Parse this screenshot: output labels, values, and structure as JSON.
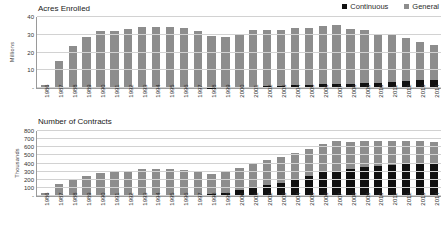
{
  "legend": {
    "items": [
      {
        "label": "Continuous",
        "icon": "square-swatch",
        "color": "#111111"
      },
      {
        "label": "General",
        "icon": "square-swatch",
        "color": "#8d8d8d"
      }
    ]
  },
  "chart_data": [
    {
      "type": "bar",
      "stacked": true,
      "title": "Acres Enrolled",
      "xlabel": "",
      "ylabel": "Millions",
      "ylim": [
        0,
        40
      ],
      "yticks": [
        0,
        10,
        20,
        30,
        40
      ],
      "ytick_labels": [
        "-",
        "10",
        "20",
        "30",
        "40"
      ],
      "grid": true,
      "legend_position": "top-right",
      "categories": [
        "1986",
        "1987",
        "1988",
        "1989",
        "1990",
        "1991",
        "1992",
        "1993",
        "1994",
        "1995",
        "1996",
        "1997",
        "1998",
        "1999",
        "2000",
        "2001",
        "2002",
        "2003",
        "2004",
        "2005",
        "2006",
        "2007",
        "2008",
        "2009",
        "2010",
        "2011",
        "2012",
        "2013",
        "2014"
      ],
      "series": [
        {
          "name": "Continuous",
          "color": "#111111",
          "values": [
            0,
            0,
            0,
            0,
            0,
            0,
            0,
            0,
            0,
            0,
            0,
            0,
            0.2,
            0.3,
            0.5,
            0.8,
            1.0,
            1.3,
            1.6,
            1.9,
            2.0,
            2.1,
            2.3,
            2.6,
            3.1,
            3.6,
            3.9,
            4.4,
            4.6
          ]
        },
        {
          "name": "General",
          "color": "#8d8d8d",
          "values": [
            1.5,
            15.2,
            23.5,
            28.6,
            31.9,
            32.3,
            33.4,
            34.3,
            34.3,
            34.3,
            33.7,
            32.2,
            29.1,
            28.7,
            30.0,
            31.8,
            31.9,
            31.6,
            32.1,
            32.1,
            33.0,
            33.3,
            31.2,
            30.0,
            27.1,
            26.6,
            24.3,
            21.5,
            19.7
          ]
        }
      ],
      "totals": [
        1.5,
        15.2,
        23.5,
        28.6,
        31.9,
        32.3,
        33.4,
        34.3,
        34.3,
        34.3,
        33.7,
        32.2,
        29.3,
        29.0,
        30.5,
        32.6,
        32.9,
        32.9,
        33.7,
        34.0,
        35.0,
        35.4,
        33.5,
        32.6,
        30.2,
        30.2,
        28.2,
        25.9,
        24.3
      ]
    },
    {
      "type": "bar",
      "stacked": true,
      "title": "Number of Contracts",
      "xlabel": "",
      "ylabel": "Thousands",
      "ylim": [
        0,
        800
      ],
      "yticks": [
        0,
        100,
        200,
        300,
        400,
        500,
        600,
        700,
        800
      ],
      "ytick_labels": [
        "-",
        "100",
        "200",
        "300",
        "400",
        "500",
        "600",
        "700",
        "800"
      ],
      "grid": true,
      "legend_position": "top-right",
      "categories": [
        "1986",
        "1987",
        "1988",
        "1989",
        "1990",
        "1991",
        "1992",
        "1993",
        "1994",
        "1995",
        "1996",
        "1997",
        "1998",
        "1999",
        "2000",
        "2001",
        "2002",
        "2003",
        "2004",
        "2005",
        "2006",
        "2007",
        "2008",
        "2009",
        "2010",
        "2011",
        "2012",
        "2013",
        "2014"
      ],
      "series": [
        {
          "name": "Continuous",
          "color": "#111111",
          "values": [
            0,
            0,
            0,
            0,
            0,
            0,
            0,
            0,
            0,
            0,
            0,
            0,
            25,
            40,
            70,
            100,
            130,
            165,
            200,
            245,
            290,
            310,
            330,
            360,
            375,
            385,
            395,
            400,
            405
          ]
        },
        {
          "name": "General",
          "color": "#8d8d8d",
          "values": [
            40,
            150,
            205,
            250,
            285,
            290,
            310,
            330,
            330,
            330,
            325,
            310,
            240,
            250,
            275,
            300,
            310,
            315,
            330,
            335,
            350,
            365,
            340,
            320,
            300,
            295,
            285,
            275,
            260
          ]
        }
      ],
      "totals": [
        40,
        150,
        205,
        250,
        285,
        290,
        310,
        330,
        330,
        330,
        325,
        310,
        265,
        290,
        345,
        400,
        440,
        480,
        530,
        580,
        640,
        675,
        670,
        680,
        675,
        680,
        680,
        675,
        665
      ]
    }
  ]
}
